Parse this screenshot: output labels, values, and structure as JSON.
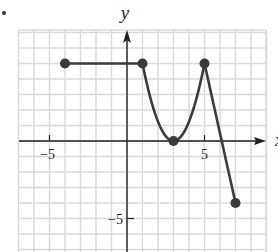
{
  "bullet": "•",
  "chart_data": {
    "type": "line",
    "title": "",
    "xlabel": "x",
    "ylabel": "y",
    "xlim": [
      -7,
      9
    ],
    "ylim": [
      -7,
      7
    ],
    "grid": true,
    "tick_labels": {
      "x": [
        "-5",
        "5"
      ],
      "y": [
        "-5"
      ]
    },
    "series": [
      {
        "name": "segment-horizontal",
        "shape": "line",
        "points": [
          [
            -4,
            5
          ],
          [
            1,
            5
          ]
        ]
      },
      {
        "name": "parabola-down",
        "shape": "curve",
        "points": [
          [
            1,
            5
          ],
          [
            2,
            1.25
          ],
          [
            3,
            0
          ]
        ]
      },
      {
        "name": "parabola-up",
        "shape": "curve",
        "points": [
          [
            3,
            0
          ],
          [
            4,
            1.25
          ],
          [
            5,
            5
          ]
        ]
      },
      {
        "name": "segment-steep",
        "shape": "line",
        "points": [
          [
            5,
            5
          ],
          [
            7,
            -4
          ]
        ]
      }
    ],
    "endpoints": [
      [
        -4,
        5
      ],
      [
        1,
        5
      ],
      [
        3,
        0
      ],
      [
        5,
        5
      ],
      [
        7,
        -4
      ]
    ],
    "colors": {
      "curve": "#3a3a3a",
      "axis": "#222222",
      "grid": "#d8d8d8"
    }
  }
}
